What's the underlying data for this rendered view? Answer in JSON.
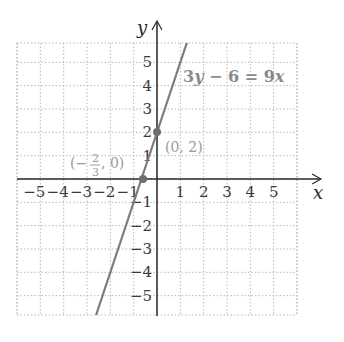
{
  "chart_data": {
    "type": "line",
    "title": "",
    "xlabel": "x",
    "ylabel": "y",
    "xlim": [
      -6,
      6
    ],
    "ylim": [
      -6,
      6
    ],
    "grid": true,
    "grid_style": "dotted",
    "x_ticks": [
      "−5",
      "−4",
      "−3",
      "−2",
      "−1",
      "1",
      "2",
      "3",
      "4",
      "5"
    ],
    "x_tick_values": [
      -5,
      -4,
      -3,
      -2,
      -1,
      1,
      2,
      3,
      4,
      5
    ],
    "y_ticks": [
      "5",
      "4",
      "3",
      "2",
      "1",
      "−1",
      "−2",
      "−3",
      "−4",
      "−5"
    ],
    "y_tick_values": [
      5,
      4,
      3,
      2,
      1,
      -1,
      -2,
      -3,
      -4,
      -5
    ],
    "series": [
      {
        "name": "3y − 6 = 9x",
        "equation": "y = 3x + 2",
        "color": "#7a7a7a",
        "x": [
          -2.67,
          1.33
        ],
        "y": [
          -6,
          6
        ]
      }
    ],
    "points": [
      {
        "label": "(0, 2)",
        "x": 0,
        "y": 2
      },
      {
        "label": "(−2/3, 0)",
        "x": -0.667,
        "y": 0
      }
    ],
    "annotations": [
      {
        "text": "3y − 6 = 9x",
        "x": 1.2,
        "y": 4.3
      }
    ]
  },
  "labels": {
    "x_axis": "x",
    "y_axis": "y",
    "equation_parts": {
      "a": "3",
      "b": "y",
      "c": " − 6 = 9",
      "d": "x"
    },
    "point1": "(0, 2)",
    "point2_open": "(−",
    "point2_num": "2",
    "point2_den": "3",
    "point2_close": ", 0)"
  },
  "colors": {
    "axis": "#2a2a2a",
    "grid": "#b8b8b8",
    "line": "#7a7a7a",
    "point": "#6e6e6e",
    "label": "#9a9a9a"
  }
}
